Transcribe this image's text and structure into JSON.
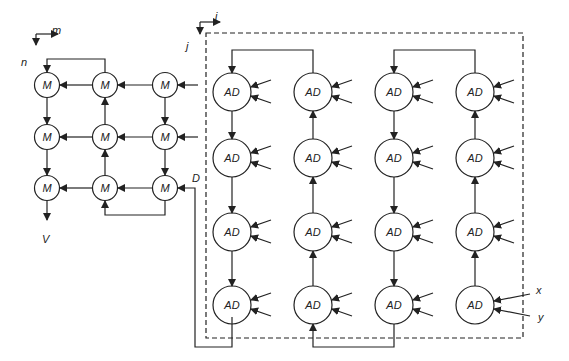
{
  "figure": {
    "type": "systolic-array-diagram",
    "line_color": "#222222",
    "background": "#ffffff"
  },
  "left_array": {
    "axis_labels": {
      "horizontal": "m",
      "vertical": "n"
    },
    "node_label": "M",
    "rows": 3,
    "cols": 3,
    "output_label": "V",
    "input_label": "D",
    "nodes": [
      {
        "row": 0,
        "col": 0,
        "label": "M"
      },
      {
        "row": 0,
        "col": 1,
        "label": "M"
      },
      {
        "row": 0,
        "col": 2,
        "label": "M"
      },
      {
        "row": 1,
        "col": 0,
        "label": "M"
      },
      {
        "row": 1,
        "col": 1,
        "label": "M"
      },
      {
        "row": 1,
        "col": 2,
        "label": "M"
      },
      {
        "row": 2,
        "col": 0,
        "label": "M"
      },
      {
        "row": 2,
        "col": 1,
        "label": "M"
      },
      {
        "row": 2,
        "col": 2,
        "label": "M"
      }
    ]
  },
  "right_array": {
    "axis_labels": {
      "horizontal": "i",
      "vertical": "j"
    },
    "node_label": "AD",
    "rows": 4,
    "cols": 4,
    "input_labels": {
      "x": "x",
      "y": "y"
    },
    "nodes": [
      {
        "row": 0,
        "col": 0,
        "label": "AD"
      },
      {
        "row": 0,
        "col": 1,
        "label": "AD"
      },
      {
        "row": 0,
        "col": 2,
        "label": "AD"
      },
      {
        "row": 0,
        "col": 3,
        "label": "AD"
      },
      {
        "row": 1,
        "col": 0,
        "label": "AD"
      },
      {
        "row": 1,
        "col": 1,
        "label": "AD"
      },
      {
        "row": 1,
        "col": 2,
        "label": "AD"
      },
      {
        "row": 1,
        "col": 3,
        "label": "AD"
      },
      {
        "row": 2,
        "col": 0,
        "label": "AD"
      },
      {
        "row": 2,
        "col": 1,
        "label": "AD"
      },
      {
        "row": 2,
        "col": 2,
        "label": "AD"
      },
      {
        "row": 2,
        "col": 3,
        "label": "AD"
      },
      {
        "row": 3,
        "col": 0,
        "label": "AD"
      },
      {
        "row": 3,
        "col": 1,
        "label": "AD"
      },
      {
        "row": 3,
        "col": 2,
        "label": "AD"
      },
      {
        "row": 3,
        "col": 3,
        "label": "AD"
      }
    ]
  }
}
